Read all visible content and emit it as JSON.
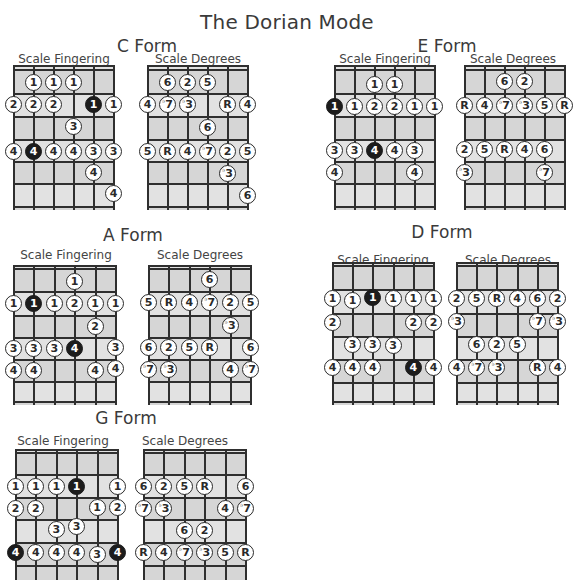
{
  "title": "The Dorian Mode",
  "colors": {
    "board_fill": "#d6d6d6",
    "line": "#2f2f2f",
    "note_fill": "#ffffff",
    "root_fill": "#1c1c1c"
  },
  "sub_labels": {
    "fingering": "Scale Fingering",
    "degrees": "Scale Degrees"
  },
  "forms": [
    {
      "name": "C Form",
      "label_pos": [
        147,
        36
      ],
      "fingering_label_pos": [
        64,
        52
      ],
      "degrees_label_pos": [
        198,
        52
      ],
      "fingering_board": {
        "x": 14,
        "y": 66,
        "w": 100,
        "h": 144,
        "frets": [
          66,
          70,
          94,
          117,
          140,
          162,
          184,
          207
        ]
      },
      "degrees_board": {
        "x": 148,
        "y": 66,
        "w": 100,
        "h": 144,
        "frets": [
          66,
          70,
          94,
          117,
          140,
          162,
          184,
          207
        ]
      },
      "fingering_notes": [
        {
          "s": 1,
          "y": 83,
          "t": "1"
        },
        {
          "s": 2,
          "y": 83,
          "t": "1"
        },
        {
          "s": 3,
          "y": 83,
          "t": "1"
        },
        {
          "s": 0,
          "y": 105,
          "t": "2"
        },
        {
          "s": 1,
          "y": 105,
          "t": "2"
        },
        {
          "s": 2,
          "y": 105,
          "t": "2"
        },
        {
          "s": 4,
          "y": 105,
          "t": "1",
          "root": true
        },
        {
          "s": 5,
          "y": 105,
          "t": "1"
        },
        {
          "s": 3,
          "y": 127,
          "t": "3"
        },
        {
          "s": 0,
          "y": 152,
          "t": "4"
        },
        {
          "s": 1,
          "y": 152,
          "t": "4",
          "root": true
        },
        {
          "s": 2,
          "y": 152,
          "t": "4"
        },
        {
          "s": 3,
          "y": 152,
          "t": "4"
        },
        {
          "s": 4,
          "y": 152,
          "t": "3"
        },
        {
          "s": 5,
          "y": 152,
          "t": "3"
        },
        {
          "s": 4,
          "y": 173,
          "t": "4"
        },
        {
          "s": 5,
          "y": 194,
          "t": "4"
        }
      ],
      "degree_notes": [
        {
          "s": 1,
          "y": 83,
          "t": "6"
        },
        {
          "s": 2,
          "y": 83,
          "t": "2"
        },
        {
          "s": 3,
          "y": 83,
          "t": "5"
        },
        {
          "s": 0,
          "y": 105,
          "t": "4"
        },
        {
          "s": 1,
          "y": 105,
          "t": "7",
          "flat": true
        },
        {
          "s": 2,
          "y": 105,
          "t": "3",
          "flat": true
        },
        {
          "s": 4,
          "y": 105,
          "t": "R"
        },
        {
          "s": 5,
          "y": 105,
          "t": "4"
        },
        {
          "s": 3,
          "y": 128,
          "t": "6"
        },
        {
          "s": 0,
          "y": 152,
          "t": "5"
        },
        {
          "s": 1,
          "y": 152,
          "t": "R"
        },
        {
          "s": 2,
          "y": 152,
          "t": "4"
        },
        {
          "s": 3,
          "y": 152,
          "t": "7",
          "flat": true
        },
        {
          "s": 4,
          "y": 152,
          "t": "2"
        },
        {
          "s": 5,
          "y": 152,
          "t": "5"
        },
        {
          "s": 4,
          "y": 174,
          "t": "3",
          "flat": true
        },
        {
          "s": 5,
          "y": 196,
          "t": "6"
        }
      ]
    },
    {
      "name": "E Form",
      "label_pos": [
        447,
        36
      ],
      "fingering_label_pos": [
        385,
        52
      ],
      "degrees_label_pos": [
        513,
        52
      ],
      "fingering_board": {
        "x": 335,
        "y": 66,
        "w": 100,
        "h": 144,
        "frets": [
          66,
          70,
          94,
          117,
          140,
          162,
          184,
          207
        ]
      },
      "degrees_board": {
        "x": 465,
        "y": 66,
        "w": 100,
        "h": 144,
        "frets": [
          66,
          70,
          94,
          117,
          140,
          162,
          184,
          207
        ]
      },
      "fingering_notes": [
        {
          "s": 2,
          "y": 85,
          "t": "1"
        },
        {
          "s": 3,
          "y": 85,
          "t": "1"
        },
        {
          "s": 0,
          "y": 107,
          "t": "1",
          "root": true
        },
        {
          "s": 1,
          "y": 107,
          "t": "1"
        },
        {
          "s": 2,
          "y": 107,
          "t": "2"
        },
        {
          "s": 3,
          "y": 107,
          "t": "2"
        },
        {
          "s": 4,
          "y": 107,
          "t": "1"
        },
        {
          "s": 5,
          "y": 107,
          "t": "1"
        },
        {
          "s": 0,
          "y": 151,
          "t": "3"
        },
        {
          "s": 1,
          "y": 151,
          "t": "3"
        },
        {
          "s": 2,
          "y": 151,
          "t": "4",
          "root": true
        },
        {
          "s": 3,
          "y": 151,
          "t": "4"
        },
        {
          "s": 4,
          "y": 151,
          "t": "3"
        },
        {
          "s": 0,
          "y": 173,
          "t": "4"
        },
        {
          "s": 4,
          "y": 173,
          "t": "4"
        }
      ],
      "degree_notes": [
        {
          "s": 2,
          "y": 82,
          "t": "6"
        },
        {
          "s": 3,
          "y": 82,
          "t": "2"
        },
        {
          "s": 0,
          "y": 106,
          "t": "R"
        },
        {
          "s": 1,
          "y": 106,
          "t": "4"
        },
        {
          "s": 2,
          "y": 106,
          "t": "7",
          "flat": true
        },
        {
          "s": 3,
          "y": 106,
          "t": "3",
          "flat": true
        },
        {
          "s": 4,
          "y": 106,
          "t": "5"
        },
        {
          "s": 5,
          "y": 106,
          "t": "R"
        },
        {
          "s": 0,
          "y": 150,
          "t": "2"
        },
        {
          "s": 1,
          "y": 150,
          "t": "5"
        },
        {
          "s": 2,
          "y": 150,
          "t": "R"
        },
        {
          "s": 3,
          "y": 150,
          "t": "4"
        },
        {
          "s": 4,
          "y": 150,
          "t": "6"
        },
        {
          "s": 0,
          "y": 173,
          "t": "3",
          "flat": true
        },
        {
          "s": 4,
          "y": 173,
          "t": "7",
          "flat": true
        }
      ]
    },
    {
      "name": "A Form",
      "label_pos": [
        133,
        225
      ],
      "fingering_label_pos": [
        66,
        248
      ],
      "degrees_label_pos": [
        200,
        248
      ],
      "fingering_board": {
        "x": 14,
        "y": 266,
        "w": 102,
        "h": 139,
        "frets": [
          266,
          269,
          292,
          316,
          338,
          360,
          382,
          402
        ]
      },
      "degrees_board": {
        "x": 149,
        "y": 266,
        "w": 102,
        "h": 139,
        "frets": [
          266,
          269,
          292,
          316,
          338,
          360,
          382,
          402
        ]
      },
      "fingering_notes": [
        {
          "s": 3,
          "y": 282,
          "t": "1"
        },
        {
          "s": 0,
          "y": 304,
          "t": "1"
        },
        {
          "s": 1,
          "y": 304,
          "t": "1",
          "root": true
        },
        {
          "s": 2,
          "y": 304,
          "t": "1"
        },
        {
          "s": 3,
          "y": 304,
          "t": "2"
        },
        {
          "s": 4,
          "y": 304,
          "t": "1"
        },
        {
          "s": 5,
          "y": 304,
          "t": "1"
        },
        {
          "s": 4,
          "y": 327,
          "t": "2"
        },
        {
          "s": 0,
          "y": 349,
          "t": "3"
        },
        {
          "s": 1,
          "y": 349,
          "t": "3"
        },
        {
          "s": 2,
          "y": 349,
          "t": "3"
        },
        {
          "s": 3,
          "y": 349,
          "t": "4",
          "root": true
        },
        {
          "s": 5,
          "y": 348,
          "t": "3"
        },
        {
          "s": 0,
          "y": 371,
          "t": "4"
        },
        {
          "s": 1,
          "y": 371,
          "t": "4"
        },
        {
          "s": 4,
          "y": 371,
          "t": "4"
        },
        {
          "s": 5,
          "y": 369,
          "t": "4"
        }
      ],
      "degree_notes": [
        {
          "s": 3,
          "y": 280,
          "t": "6"
        },
        {
          "s": 0,
          "y": 303,
          "t": "5"
        },
        {
          "s": 1,
          "y": 303,
          "t": "R"
        },
        {
          "s": 2,
          "y": 303,
          "t": "4"
        },
        {
          "s": 3,
          "y": 303,
          "t": "7",
          "flat": true
        },
        {
          "s": 4,
          "y": 303,
          "t": "2"
        },
        {
          "s": 5,
          "y": 303,
          "t": "5"
        },
        {
          "s": 4,
          "y": 326,
          "t": "3",
          "flat": true
        },
        {
          "s": 0,
          "y": 348,
          "t": "6"
        },
        {
          "s": 1,
          "y": 348,
          "t": "2"
        },
        {
          "s": 2,
          "y": 348,
          "t": "5"
        },
        {
          "s": 3,
          "y": 348,
          "t": "R"
        },
        {
          "s": 5,
          "y": 348,
          "t": "6"
        },
        {
          "s": 0,
          "y": 370,
          "t": "7",
          "flat": true
        },
        {
          "s": 1,
          "y": 370,
          "t": "3",
          "flat": true
        },
        {
          "s": 4,
          "y": 370,
          "t": "4"
        },
        {
          "s": 5,
          "y": 370,
          "t": "7",
          "flat": true
        }
      ]
    },
    {
      "name": "D Form",
      "label_pos": [
        442,
        222
      ],
      "fingering_label_pos": [
        383,
        253
      ],
      "degrees_label_pos": [
        508,
        253
      ],
      "fingering_board": {
        "x": 333,
        "y": 263,
        "w": 101,
        "h": 142,
        "frets": [
          263,
          266,
          290,
          314,
          337,
          360,
          383,
          402
        ]
      },
      "degrees_board": {
        "x": 457,
        "y": 263,
        "w": 101,
        "h": 142,
        "frets": [
          263,
          266,
          290,
          314,
          337,
          360,
          383,
          402
        ]
      },
      "fingering_notes": [
        {
          "s": 0,
          "y": 299,
          "t": "1"
        },
        {
          "s": 1,
          "y": 301,
          "t": "1"
        },
        {
          "s": 2,
          "y": 298,
          "t": "1",
          "root": true
        },
        {
          "s": 3,
          "y": 299,
          "t": "1"
        },
        {
          "s": 4,
          "y": 299,
          "t": "1"
        },
        {
          "s": 5,
          "y": 299,
          "t": "1"
        },
        {
          "s": 0,
          "y": 323,
          "t": "2"
        },
        {
          "s": 4,
          "y": 323,
          "t": "2"
        },
        {
          "s": 5,
          "y": 323,
          "t": "2"
        },
        {
          "s": 1,
          "y": 345,
          "t": "3"
        },
        {
          "s": 2,
          "y": 345,
          "t": "3"
        },
        {
          "s": 3,
          "y": 346,
          "t": "3"
        },
        {
          "s": 0,
          "y": 368,
          "t": "4"
        },
        {
          "s": 1,
          "y": 368,
          "t": "4"
        },
        {
          "s": 2,
          "y": 368,
          "t": "4"
        },
        {
          "s": 4,
          "y": 368,
          "t": "4",
          "root": true
        },
        {
          "s": 5,
          "y": 368,
          "t": "4"
        }
      ],
      "degree_notes": [
        {
          "s": 0,
          "y": 299,
          "t": "2"
        },
        {
          "s": 1,
          "y": 299,
          "t": "5"
        },
        {
          "s": 2,
          "y": 299,
          "t": "R"
        },
        {
          "s": 3,
          "y": 299,
          "t": "4"
        },
        {
          "s": 4,
          "y": 299,
          "t": "6"
        },
        {
          "s": 5,
          "y": 299,
          "t": "2"
        },
        {
          "s": 0,
          "y": 322,
          "t": "3",
          "flat": true
        },
        {
          "s": 4,
          "y": 322,
          "t": "7",
          "flat": true
        },
        {
          "s": 5,
          "y": 322,
          "t": "3",
          "flat": true
        },
        {
          "s": 1,
          "y": 345,
          "t": "6"
        },
        {
          "s": 2,
          "y": 345,
          "t": "2"
        },
        {
          "s": 3,
          "y": 345,
          "t": "5"
        },
        {
          "s": 0,
          "y": 368,
          "t": "4"
        },
        {
          "s": 1,
          "y": 368,
          "t": "7",
          "flat": true
        },
        {
          "s": 2,
          "y": 368,
          "t": "3",
          "flat": true
        },
        {
          "s": 4,
          "y": 368,
          "t": "R"
        },
        {
          "s": 5,
          "y": 368,
          "t": "4"
        }
      ]
    },
    {
      "name": "G Form",
      "label_pos": [
        126,
        408
      ],
      "fingering_label_pos": [
        63,
        434
      ],
      "degrees_label_pos": [
        185,
        434
      ],
      "fingering_board": {
        "x": 16,
        "y": 450,
        "w": 102,
        "h": 130,
        "frets": [
          450,
          453,
          475,
          498,
          520,
          543,
          566
        ]
      },
      "degrees_board": {
        "x": 144,
        "y": 450,
        "w": 102,
        "h": 130,
        "frets": [
          450,
          453,
          475,
          498,
          520,
          543,
          566
        ]
      },
      "fingering_notes": [
        {
          "s": 0,
          "y": 487,
          "t": "1"
        },
        {
          "s": 1,
          "y": 487,
          "t": "1"
        },
        {
          "s": 2,
          "y": 487,
          "t": "1"
        },
        {
          "s": 3,
          "y": 487,
          "t": "1",
          "root": true
        },
        {
          "s": 5,
          "y": 487,
          "t": "1"
        },
        {
          "s": 0,
          "y": 509,
          "t": "2"
        },
        {
          "s": 1,
          "y": 509,
          "t": "2"
        },
        {
          "s": 4,
          "y": 508,
          "t": "1"
        },
        {
          "s": 5,
          "y": 508,
          "t": "2"
        },
        {
          "s": 2,
          "y": 530,
          "t": "3"
        },
        {
          "s": 3,
          "y": 527,
          "t": "3"
        },
        {
          "s": 0,
          "y": 553,
          "t": "4",
          "root": true
        },
        {
          "s": 1,
          "y": 553,
          "t": "4"
        },
        {
          "s": 2,
          "y": 553,
          "t": "4"
        },
        {
          "s": 3,
          "y": 553,
          "t": "4"
        },
        {
          "s": 4,
          "y": 555,
          "t": "3"
        },
        {
          "s": 5,
          "y": 553,
          "t": "4",
          "root": true
        }
      ],
      "degree_notes": [
        {
          "s": 0,
          "y": 487,
          "t": "6"
        },
        {
          "s": 1,
          "y": 487,
          "t": "2"
        },
        {
          "s": 2,
          "y": 487,
          "t": "5"
        },
        {
          "s": 3,
          "y": 487,
          "t": "R"
        },
        {
          "s": 5,
          "y": 487,
          "t": "6"
        },
        {
          "s": 0,
          "y": 509,
          "t": "7",
          "flat": true
        },
        {
          "s": 1,
          "y": 509,
          "t": "3",
          "flat": true
        },
        {
          "s": 4,
          "y": 509,
          "t": "4"
        },
        {
          "s": 5,
          "y": 509,
          "t": "7",
          "flat": true
        },
        {
          "s": 2,
          "y": 531,
          "t": "6"
        },
        {
          "s": 3,
          "y": 531,
          "t": "2"
        },
        {
          "s": 0,
          "y": 553,
          "t": "R"
        },
        {
          "s": 1,
          "y": 553,
          "t": "4"
        },
        {
          "s": 2,
          "y": 553,
          "t": "7",
          "flat": true
        },
        {
          "s": 3,
          "y": 553,
          "t": "3",
          "flat": true
        },
        {
          "s": 4,
          "y": 553,
          "t": "5"
        },
        {
          "s": 5,
          "y": 553,
          "t": "R"
        }
      ]
    }
  ]
}
